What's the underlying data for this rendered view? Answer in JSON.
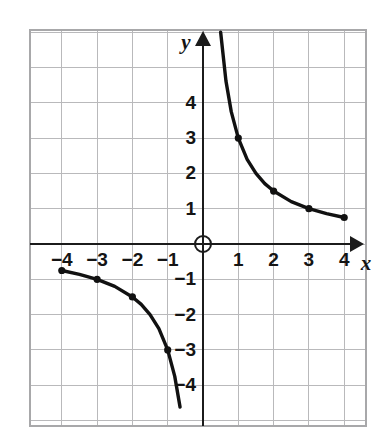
{
  "chart_data": {
    "type": "line",
    "title": "",
    "subtitle": "",
    "xlabel": "x",
    "ylabel": "y",
    "xlim": [
      -5,
      5
    ],
    "ylim": [
      -6,
      6
    ],
    "grid": true,
    "grid_spacing": 1,
    "legend": "none",
    "origin_label": "",
    "function": "y = 3/x",
    "xticks": [
      "-4",
      "-3",
      "-2",
      "-1",
      "1",
      "2",
      "3",
      "4"
    ],
    "xtick_values": [
      -4,
      -3,
      -2,
      -1,
      1,
      2,
      3,
      4
    ],
    "yticks": [
      "4",
      "3",
      "2",
      "1",
      "-1",
      "-2",
      "-3",
      "-4"
    ],
    "ytick_values": [
      4,
      3,
      2,
      1,
      -1,
      -2,
      -3,
      -4
    ],
    "series": [
      {
        "name": "branch-positive",
        "x": [
          0.34,
          0.5,
          0.65,
          0.8,
          1,
          1.25,
          1.5,
          1.75,
          2,
          2.5,
          3,
          3.5,
          4
        ],
        "y": [
          8.82,
          6,
          4.62,
          3.75,
          3,
          2.4,
          2,
          1.71,
          1.5,
          1.2,
          1,
          0.86,
          0.75
        ],
        "marked_points": [
          {
            "x": 1,
            "y": 3
          },
          {
            "x": 2,
            "y": 1.5
          },
          {
            "x": 3,
            "y": 1
          },
          {
            "x": 4,
            "y": 0.75
          }
        ]
      },
      {
        "name": "branch-negative",
        "x": [
          -4,
          -3.5,
          -3,
          -2.5,
          -2,
          -1.75,
          -1.5,
          -1.25,
          -1,
          -0.8,
          -0.65
        ],
        "y": [
          -0.75,
          -0.86,
          -1,
          -1.2,
          -1.5,
          -1.71,
          -2,
          -2.4,
          -3,
          -3.75,
          -4.62
        ],
        "marked_points": [
          {
            "x": -4,
            "y": -0.75
          },
          {
            "x": -3,
            "y": -1
          },
          {
            "x": -2,
            "y": -1.5
          },
          {
            "x": -1,
            "y": -3
          }
        ]
      }
    ],
    "colors": {
      "curve": "#111111",
      "grid": "#b9b9bb",
      "axis": "#1b1b1b",
      "background": "#ffffff",
      "label": "#141414"
    }
  },
  "axis_labels": {
    "x": "x",
    "y": "y"
  }
}
